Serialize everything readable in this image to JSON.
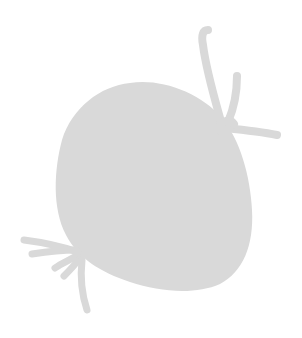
{
  "image": {
    "width": 302,
    "height": 338,
    "background": "#ffffff",
    "subject": "gray silhouette of a rounded blob with tendrils",
    "fill_color": "#d9d9d9"
  }
}
